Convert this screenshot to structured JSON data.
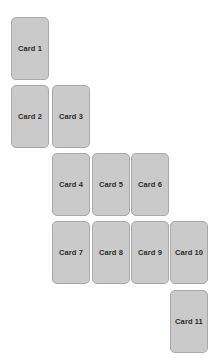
{
  "board": {
    "name": "card-cascade-board",
    "background_color": "#ffffff",
    "width": 221,
    "height": 358,
    "rows": 5,
    "columns": 5,
    "card_count": 11,
    "card_width": 38,
    "card_height": 63,
    "gap_x": 3,
    "gap_y": 4,
    "card_fill_color": "#cacaca",
    "card_border_color": "#a8a8a8",
    "card_text_color": "#2b2b2b",
    "column_x": [
      11,
      52,
      92,
      131,
      170
    ],
    "row_y": [
      17,
      85,
      153,
      221,
      290
    ]
  },
  "cards": [
    {
      "label": "Card 1",
      "row": 0,
      "col": 0,
      "x": 11,
      "y": 17
    },
    {
      "label": "Card 2",
      "row": 1,
      "col": 0,
      "x": 11,
      "y": 85
    },
    {
      "label": "Card 3",
      "row": 1,
      "col": 1,
      "x": 52,
      "y": 85
    },
    {
      "label": "Card 4",
      "row": 2,
      "col": 1,
      "x": 52,
      "y": 153
    },
    {
      "label": "Card 5",
      "row": 2,
      "col": 2,
      "x": 92,
      "y": 153
    },
    {
      "label": "Card 6",
      "row": 2,
      "col": 3,
      "x": 131,
      "y": 153
    },
    {
      "label": "Card 7",
      "row": 3,
      "col": 1,
      "x": 52,
      "y": 221
    },
    {
      "label": "Card 8",
      "row": 3,
      "col": 2,
      "x": 92,
      "y": 221
    },
    {
      "label": "Card 9",
      "row": 3,
      "col": 3,
      "x": 131,
      "y": 221
    },
    {
      "label": "Card 10",
      "row": 3,
      "col": 4,
      "x": 170,
      "y": 221
    },
    {
      "label": "Card 11",
      "row": 4,
      "col": 4,
      "x": 170,
      "y": 290
    }
  ]
}
